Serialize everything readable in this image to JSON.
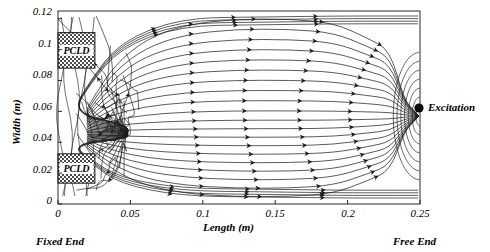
{
  "figure": {
    "type": "streamline-plot",
    "background": "#ffffff",
    "line_color": "#1a1a1a"
  },
  "axes": {
    "x": {
      "label": "Length (m)",
      "ticks": [
        "0",
        "0.05",
        "0.1",
        "0.15",
        "0.2",
        "0.25"
      ],
      "tick_values": [
        0,
        0.05,
        0.1,
        0.15,
        0.2,
        0.25
      ],
      "range": [
        0,
        0.25
      ]
    },
    "y": {
      "label": "Width (m)",
      "ticks": [
        "0",
        "0.02",
        "0.04",
        "0.06",
        "0.08",
        "0.1",
        "0.12"
      ],
      "tick_values": [
        0,
        0.02,
        0.04,
        0.06,
        0.08,
        0.1,
        0.12
      ],
      "range": [
        0,
        0.125
      ]
    }
  },
  "annotations": {
    "fixed_end": "Fixed End",
    "free_end": "Free End",
    "excitation": "Excitation",
    "excitation_point": {
      "x": 0.25,
      "y": 0.057
    },
    "patches": [
      {
        "label": "PCLD",
        "x0": 0.0,
        "x1": 0.0255,
        "y0": 0.088,
        "y1": 0.111
      },
      {
        "label": "PCLD",
        "x0": 0.0,
        "x1": 0.0255,
        "y0": 0.0135,
        "y1": 0.0325
      }
    ]
  },
  "chart_data": {
    "type": "line",
    "title": "",
    "xlabel": "Length (m)",
    "ylabel": "Width (m)",
    "xlim": [
      0,
      0.25
    ],
    "ylim": [
      0,
      0.125
    ],
    "grid": false,
    "legend": "none",
    "focus_point": {
      "x": 0.047,
      "y": 0.0455
    },
    "source_point": {
      "x": 0.25,
      "y": 0.057
    },
    "arrow_direction": "leftward (from free end toward fixed end)",
    "streamline_count": 46
  }
}
